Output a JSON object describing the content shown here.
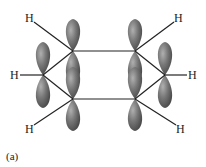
{
  "diagram": {
    "labels": {
      "h_top_left": "H",
      "h_top_right": "H",
      "h_left": "H",
      "h_right": "H",
      "h_bottom_left": "H",
      "h_bottom_right": "H"
    },
    "caption": "(a)",
    "colors": {
      "orbital": "#6e6e6e",
      "bond": "#222222"
    }
  }
}
